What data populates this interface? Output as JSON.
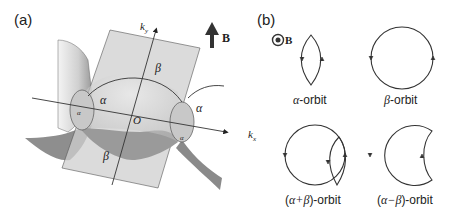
{
  "figure": {
    "panel_a": {
      "label": "(a)",
      "axis_ky": "k",
      "axis_ky_sub": "y",
      "axis_kx": "k",
      "axis_kx_sub": "x",
      "origin": "O",
      "field": "B",
      "labels": {
        "alpha_left": "α",
        "alpha_right": "α",
        "beta_top": "β",
        "beta_bottom": "β",
        "alpha_small_left": "α",
        "alpha_small_right": "α"
      }
    },
    "panel_b": {
      "label": "(b)",
      "field": "B",
      "orbits": [
        {
          "greek": "α",
          "suffix": "-orbit"
        },
        {
          "greek": "β",
          "suffix": "-orbit"
        },
        {
          "prefix": "(",
          "greek": "α+β",
          "suffix": ")-orbit"
        },
        {
          "prefix": "(",
          "greek": "α−β",
          "suffix": ")-orbit"
        }
      ]
    },
    "colors": {
      "surface_light": "#d9d9d9",
      "surface_dark": "#8a8a8a",
      "plane": "#cfcfcf",
      "line": "#333333"
    }
  }
}
